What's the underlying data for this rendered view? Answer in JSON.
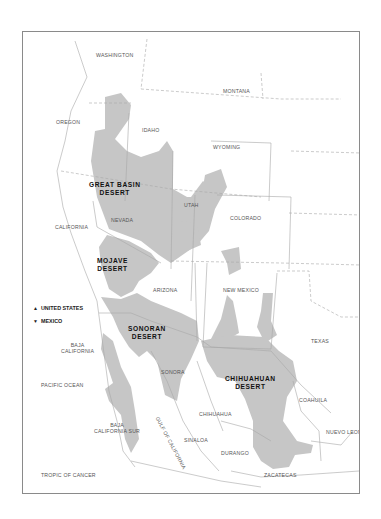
{
  "map": {
    "colors": {
      "desert_fill": "#c6c6c6",
      "land": "#ffffff",
      "border": "#9a9a9a",
      "frame": "#8a8a8a"
    },
    "deserts": [
      {
        "name": "GREAT BASIN",
        "line2": "DESERT"
      },
      {
        "name": "MOJAVE",
        "line2": "DESERT"
      },
      {
        "name": "SONORAN",
        "line2": "DESERT"
      },
      {
        "name": "CHIHUAHUAN",
        "line2": "DESERT"
      }
    ],
    "states_us": [
      "WASHINGTON",
      "MONTANA",
      "OREGON",
      "IDAHO",
      "WYOMING",
      "NEVADA",
      "UTAH",
      "COLORADO",
      "CALIFORNIA",
      "ARIZONA",
      "NEW MEXICO",
      "TEXAS"
    ],
    "states_mx": {
      "baja_california": [
        "BAJA",
        "CALIFORNIA"
      ],
      "baja_california_sur": [
        "BAJA",
        "CALIFORNIA SUR"
      ],
      "sonora": "SONORA",
      "chihuahua": "CHIHUAHUA",
      "coahuila": "COAHUILA",
      "nuevo_leon": "NUEVO LEON",
      "sinaloa": "SINALOA",
      "durango": "DURANGO",
      "zacatecas": "ZACATECAS"
    },
    "water": {
      "pacific": "PACIFIC OCEAN",
      "gulf": "GULF OF CALIFORNIA"
    },
    "other": {
      "tropic": "TROPIC OF CANCER"
    },
    "legend": {
      "up_symbol": "▲",
      "up_label": "UNITED STATES",
      "down_symbol": "▼",
      "down_label": "MEXICO"
    }
  }
}
